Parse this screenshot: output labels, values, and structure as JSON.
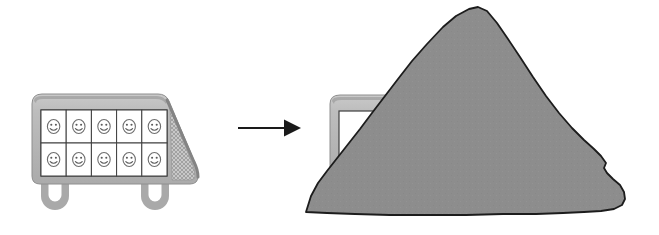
{
  "scene": {
    "title": "Loaded truck transforms into covered pile",
    "width": 659,
    "height": 235,
    "background_color": "#ffffff"
  },
  "colors": {
    "truck_body": "#b0b0b0",
    "truck_body_light": "#c4c4c4",
    "truck_shadow": "#8f8f8f",
    "truck_outline": "#9a9a9a",
    "cargo_cell_fill": "#ffffff",
    "cargo_cell_stroke": "#4a4a4a",
    "face_stroke": "#6a6a6a",
    "wheel": "#a8a8a8",
    "arrow": "#1a1a1a",
    "rock_fill": "#8d8d8d",
    "rock_stroke": "#1c1c1c"
  },
  "left_truck": {
    "label": "loaded-truck",
    "wheel_count": 2,
    "cargo": {
      "label": "cargo-grid",
      "rows": 2,
      "columns": 5,
      "cell_count": 10,
      "cells": [
        {
          "id": "cell-r1-c1",
          "row": 1,
          "col": 1,
          "icon": "smiley-face-icon",
          "mood": "happy"
        },
        {
          "id": "cell-r1-c2",
          "row": 1,
          "col": 2,
          "icon": "smiley-face-icon",
          "mood": "happy"
        },
        {
          "id": "cell-r1-c3",
          "row": 1,
          "col": 3,
          "icon": "smiley-face-icon",
          "mood": "happy"
        },
        {
          "id": "cell-r1-c4",
          "row": 1,
          "col": 4,
          "icon": "smiley-face-icon",
          "mood": "happy"
        },
        {
          "id": "cell-r1-c5",
          "row": 1,
          "col": 5,
          "icon": "smiley-face-icon",
          "mood": "happy"
        },
        {
          "id": "cell-r2-c1",
          "row": 2,
          "col": 1,
          "icon": "smiley-face-icon",
          "mood": "happy"
        },
        {
          "id": "cell-r2-c2",
          "row": 2,
          "col": 2,
          "icon": "smiley-face-icon",
          "mood": "happy"
        },
        {
          "id": "cell-r2-c3",
          "row": 2,
          "col": 3,
          "icon": "smiley-face-icon",
          "mood": "happy"
        },
        {
          "id": "cell-r2-c4",
          "row": 2,
          "col": 4,
          "icon": "smiley-face-icon",
          "mood": "happy"
        },
        {
          "id": "cell-r2-c5",
          "row": 2,
          "col": 5,
          "icon": "smiley-face-icon",
          "mood": "happy"
        }
      ]
    },
    "cab": {
      "label": "truck-cab",
      "texture": "crosshatch-mesh"
    }
  },
  "arrow": {
    "label": "transformation-arrow",
    "direction": "right",
    "icon": "arrow-right-icon"
  },
  "right_group": {
    "label": "covered-truck",
    "truck": {
      "label": "partially-hidden-truck",
      "visible_part": "rear-left-corner"
    },
    "pile": {
      "label": "rock-pile",
      "shape": "irregular-mound",
      "icon": "rock-icon"
    }
  }
}
